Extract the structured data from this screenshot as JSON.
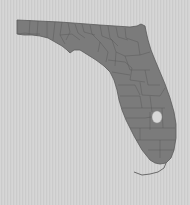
{
  "map": {
    "subject": "Florida county map",
    "regions": [
      "Florida"
    ],
    "features": [
      "county-boundaries",
      "lake-okeechobee",
      "florida-keys"
    ],
    "colors": {
      "background": "#d2d2d2",
      "land": "#7b7b7b",
      "borders": "#555555",
      "lake": "#d8d8d8"
    }
  }
}
